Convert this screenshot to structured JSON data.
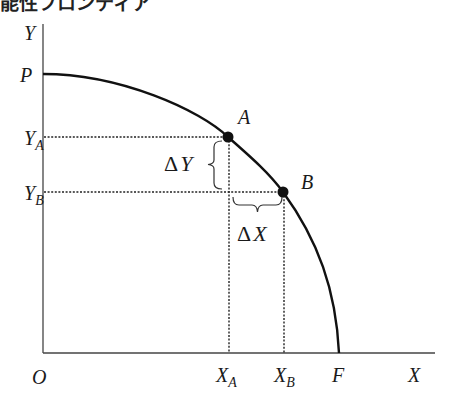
{
  "caption": "能性フロンティア",
  "diagram": {
    "type": "production-possibility-frontier",
    "axes": {
      "y_label": "Y",
      "x_label": "X",
      "origin_label": "O"
    },
    "intercepts": {
      "y_intercept_label": "P",
      "x_intercept_label": "F"
    },
    "points": [
      {
        "name": "A",
        "x_label": "X",
        "x_sub": "A",
        "y_label": "Y",
        "y_sub": "A"
      },
      {
        "name": "B",
        "x_label": "X",
        "x_sub": "B",
        "y_label": "Y",
        "y_sub": "B"
      }
    ],
    "deltas": {
      "delta_y": "ΔY",
      "delta_x": "ΔX",
      "delta_symbol": "Δ",
      "y_letter": "Y",
      "x_letter": "X"
    }
  }
}
